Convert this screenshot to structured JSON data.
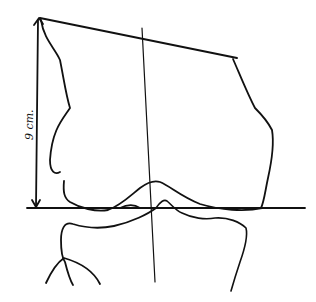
{
  "diagram": {
    "type": "anatomical-line-drawing",
    "measurement_label": "9 cm.",
    "colors": {
      "background": "#ffffff",
      "ink": "#111111"
    },
    "elements": [
      {
        "name": "vertical-measurement-arrow",
        "description": "double-headed vertical arrow on left indicating height"
      },
      {
        "name": "joint-line",
        "description": "horizontal baseline across the joint"
      },
      {
        "name": "top-oblique-line",
        "description": "oblique line across top of femur outline"
      },
      {
        "name": "femur-axis-line",
        "description": "near-vertical axis line through the center"
      },
      {
        "name": "femur-outline",
        "description": "outline of distal femur / condyles"
      },
      {
        "name": "tibia-outline",
        "description": "outline of proximal tibia and fibula"
      }
    ]
  }
}
